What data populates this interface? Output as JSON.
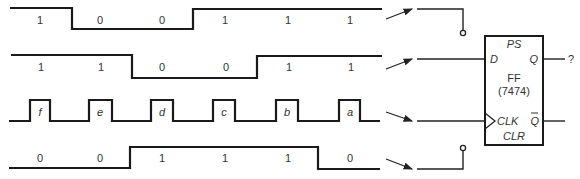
{
  "waveforms": [
    {
      "name": "preset",
      "bits": [
        "1",
        "0",
        "0",
        "1",
        "1",
        "1"
      ],
      "target": "PS"
    },
    {
      "name": "data",
      "bits": [
        "1",
        "1",
        "0",
        "0",
        "1",
        "1"
      ],
      "target": "D"
    },
    {
      "name": "clock",
      "pulses": [
        "f",
        "e",
        "d",
        "c",
        "b",
        "a"
      ],
      "target": "CLK"
    },
    {
      "name": "clear",
      "bits": [
        "0",
        "0",
        "1",
        "1",
        "1",
        "0"
      ],
      "target": "CLR"
    }
  ],
  "flipflop": {
    "title": "FF",
    "part": "(7474)",
    "pins": {
      "ps": "PS",
      "d": "D",
      "q": "Q",
      "clk": "CLK",
      "qbar": "Q",
      "clr": "CLR"
    },
    "q_output": "?"
  }
}
